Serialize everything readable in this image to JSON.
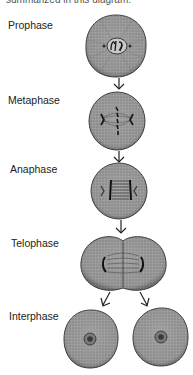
{
  "caption": "summarized in this diagram.",
  "stages": [
    {
      "id": "prophase",
      "label": "Prophase"
    },
    {
      "id": "metaphase",
      "label": "Metaphase"
    },
    {
      "id": "anaphase",
      "label": "Anaphase"
    },
    {
      "id": "telophase",
      "label": "Telophase"
    },
    {
      "id": "interphase",
      "label": "Interphase"
    }
  ],
  "colors": {
    "cell_fill": "#9a9a9a",
    "cell_edge": "#3a3a3a",
    "arrow": "#222222",
    "chromosome": "#1a1a1a"
  }
}
